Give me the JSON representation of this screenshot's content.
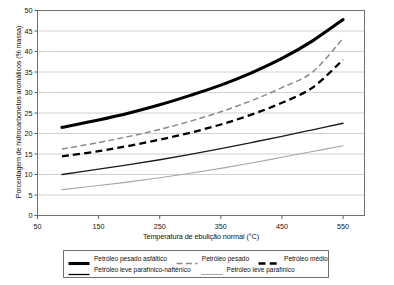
{
  "chart_data": {
    "type": "line",
    "title": "",
    "xlabel": "Temperatura de ebulição normal (°C)",
    "ylabel": "Porcentagem de hidrocarbonetos aromáticos (% massa)",
    "xlim": [
      50,
      585
    ],
    "ylim": [
      0,
      50
    ],
    "xticks": [
      50,
      150,
      250,
      350,
      450,
      550
    ],
    "yticks": [
      0,
      5,
      10,
      15,
      20,
      25,
      30,
      35,
      40,
      45,
      50
    ],
    "grid": "horizontal",
    "legend_position": "below-plot",
    "series": [
      {
        "name": "Petróleo pesado asfáltico",
        "style": "solid-thick",
        "color": "#000000",
        "x": [
          90,
          150,
          200,
          250,
          300,
          350,
          400,
          450,
          500,
          550
        ],
        "values": [
          21.5,
          23.3,
          25.0,
          27.0,
          29.3,
          31.8,
          34.8,
          38.3,
          42.6,
          47.8
        ]
      },
      {
        "name": "Petróleo pesado",
        "style": "dashed-gray",
        "color": "#8a8a8a",
        "x": [
          90,
          150,
          200,
          250,
          300,
          350,
          400,
          450,
          500,
          550
        ],
        "values": [
          16.2,
          17.8,
          19.3,
          21.0,
          23.0,
          25.3,
          28.0,
          31.2,
          35.0,
          43.2
        ]
      },
      {
        "name": "Petróleo médio",
        "style": "dashed-black",
        "color": "#000000",
        "x": [
          90,
          150,
          200,
          250,
          300,
          350,
          400,
          450,
          500,
          550
        ],
        "values": [
          14.4,
          15.7,
          17.0,
          18.5,
          20.2,
          22.2,
          24.6,
          27.5,
          31.2,
          38.0
        ]
      },
      {
        "name": "Petróleo leve parafínico-nafténico",
        "style": "solid-thin",
        "color": "#1a1a1a",
        "x": [
          90,
          150,
          200,
          250,
          300,
          350,
          400,
          450,
          500,
          550
        ],
        "values": [
          10.0,
          11.3,
          12.4,
          13.6,
          14.9,
          16.3,
          17.8,
          19.3,
          20.9,
          22.5
        ]
      },
      {
        "name": "Petróleo leve parafínico",
        "style": "solid-light",
        "color": "#a8a8a8",
        "x": [
          90,
          150,
          200,
          250,
          300,
          350,
          400,
          450,
          500,
          550
        ],
        "values": [
          6.3,
          7.3,
          8.2,
          9.2,
          10.3,
          11.5,
          12.8,
          14.2,
          15.6,
          17.0
        ]
      }
    ]
  },
  "legend": {
    "rows": [
      [
        {
          "label": "Petróleo pesado asfáltico",
          "swatch": "solid-thick"
        },
        {
          "label": "Petróleo pesado",
          "swatch": "dashed-gray"
        },
        {
          "label": "Petróleo médio",
          "swatch": "dashed-black"
        }
      ],
      [
        {
          "label": "Petróleo leve parafínico-nafténico",
          "swatch": "solid-thin"
        },
        {
          "label": "Petróleo leve parafínico",
          "swatch": "solid-light"
        }
      ]
    ]
  },
  "axes": {
    "x_title": "Temperatura de ebulição normal (°C)",
    "y_title": "Porcentagem de hidrocarbonetos aromáticos (% massa)"
  }
}
